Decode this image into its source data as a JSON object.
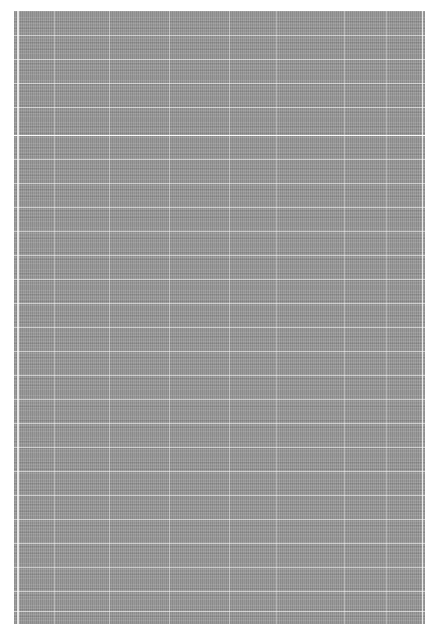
{
  "document": {
    "description": "Low-resolution scanned page of dense tabular/text content; no legible text",
    "background_color": "#ffffff",
    "scan_color": "#9a9a9a",
    "grid": {
      "horizontal_lines_y": [
        24,
        48,
        72,
        96,
        124,
        148,
        172,
        196,
        220,
        244,
        268,
        292,
        316,
        340,
        364,
        388,
        412,
        436,
        460,
        484,
        508,
        532,
        556,
        580,
        600
      ],
      "strong_line_y": 124,
      "vertical_lines_x": [
        40,
        95,
        155,
        215,
        262,
        330,
        372
      ]
    },
    "legible_text": ""
  }
}
